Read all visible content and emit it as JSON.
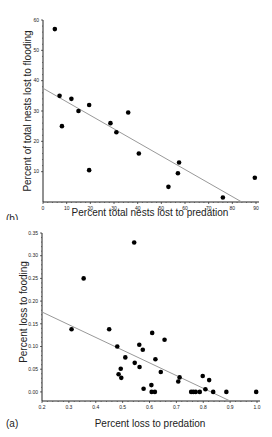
{
  "chart_data": [
    {
      "panel": "(b)",
      "type": "scatter",
      "xlabel": "Percent total nests lost to predation",
      "ylabel": "Percent of total nests lost to flooding",
      "xlim": [
        0,
        90
      ],
      "ylim": [
        0,
        60
      ],
      "xticks": [
        0,
        10,
        20,
        30,
        40,
        50,
        60,
        70,
        80,
        90
      ],
      "yticks": [
        10,
        20,
        30,
        40,
        50,
        60
      ],
      "grid": false,
      "points": [
        [
          5,
          57
        ],
        [
          7,
          35
        ],
        [
          8,
          25
        ],
        [
          12,
          34
        ],
        [
          15,
          30
        ],
        [
          19.5,
          32
        ],
        [
          19.5,
          10.5
        ],
        [
          28.5,
          26
        ],
        [
          31,
          23
        ],
        [
          36,
          29.5
        ],
        [
          40.5,
          16
        ],
        [
          53,
          5
        ],
        [
          57,
          9.5
        ],
        [
          57.5,
          13
        ],
        [
          76,
          1.5
        ],
        [
          89.5,
          8
        ]
      ],
      "regression_line": [
        [
          0,
          37.5
        ],
        [
          84,
          0
        ]
      ]
    },
    {
      "panel": "(a)",
      "type": "scatter",
      "xlabel": "Percent loss to predation",
      "ylabel": "Percent loss to fooding",
      "xlim": [
        0.2,
        1.0
      ],
      "ylim": [
        -0.02,
        0.35
      ],
      "xticks": [
        0.2,
        0.3,
        0.4,
        0.5,
        0.6,
        0.7,
        0.8,
        0.9,
        1.0
      ],
      "yticks": [
        0.0,
        0.05,
        0.1,
        0.15,
        0.2,
        0.25,
        0.3,
        0.35
      ],
      "grid": false,
      "points": [
        [
          0.543,
          0.329
        ],
        [
          0.355,
          0.25
        ],
        [
          0.31,
          0.138
        ],
        [
          0.45,
          0.138
        ],
        [
          0.48,
          0.1
        ],
        [
          0.51,
          0.076
        ],
        [
          0.493,
          0.051
        ],
        [
          0.485,
          0.039
        ],
        [
          0.495,
          0.031
        ],
        [
          0.545,
          0.064
        ],
        [
          0.562,
          0.104
        ],
        [
          0.575,
          0.093
        ],
        [
          0.563,
          0.055
        ],
        [
          0.578,
          0.007
        ],
        [
          0.607,
          0.015
        ],
        [
          0.608,
          0.0
        ],
        [
          0.62,
          0.0
        ],
        [
          0.61,
          0.13
        ],
        [
          0.622,
          0.072
        ],
        [
          0.642,
          0.044
        ],
        [
          0.656,
          0.115
        ],
        [
          0.707,
          0.023
        ],
        [
          0.712,
          0.032
        ],
        [
          0.755,
          0.0
        ],
        [
          0.763,
          0.0
        ],
        [
          0.772,
          0.0
        ],
        [
          0.787,
          0.0
        ],
        [
          0.798,
          0.035
        ],
        [
          0.808,
          0.006
        ],
        [
          0.822,
          0.026
        ],
        [
          0.837,
          0.0
        ],
        [
          0.886,
          0.0
        ],
        [
          0.997,
          0.0
        ]
      ],
      "regression_line": [
        [
          0.2,
          0.176
        ],
        [
          0.9,
          -0.02
        ]
      ]
    }
  ],
  "labels": {
    "top_xlabel": "Percent total nests lost to predation",
    "top_ylabel": "Percent of total nests lost to flooding",
    "top_panel": "(b)",
    "bottom_xlabel": "Percent loss to predation",
    "bottom_ylabel": "Percent loss to fooding",
    "bottom_panel": "(a)"
  },
  "colors": {
    "point": "#000000",
    "regression": "#999999",
    "axis": "#222222"
  }
}
